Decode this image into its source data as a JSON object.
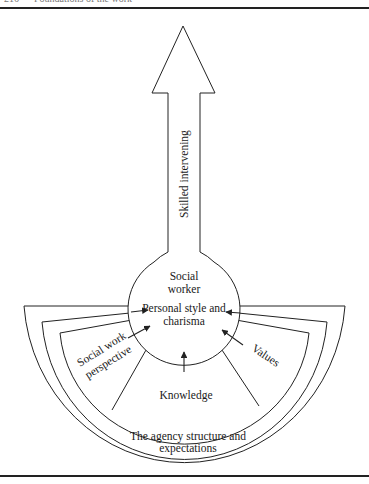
{
  "running_head": "216 — Foundations of the work",
  "diagram": {
    "arrow_label": "Skilled intervening",
    "center": {
      "line1": "Social",
      "line2": "worker",
      "line3": "Personal style and",
      "line4": "charisma"
    },
    "inner_segments": {
      "left": [
        "Social work",
        "perspective"
      ],
      "middle": "Knowledge",
      "right": "Values"
    },
    "outer_band": [
      "The agency structure and",
      "expectations"
    ],
    "stroke_color": "#222222",
    "background": "#ffffff"
  }
}
